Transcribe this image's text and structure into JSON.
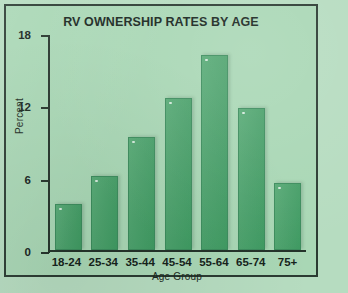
{
  "chart_data": {
    "type": "bar",
    "title": "RV OWNERSHIP RATES BY AGE",
    "xlabel": "Age Group",
    "ylabel": "Percent",
    "categories": [
      "18-24",
      "25-34",
      "35-44",
      "45-54",
      "55-64",
      "65-74",
      "75+"
    ],
    "values": [
      3.8,
      6.1,
      9.4,
      12.6,
      16.2,
      11.8,
      5.6
    ],
    "ylim": [
      0,
      18
    ],
    "yticks": [
      0,
      6,
      12,
      18
    ],
    "ytick_labels": [
      "0",
      "6",
      "12",
      "18"
    ],
    "grid": false,
    "legend": null,
    "series": [
      {
        "name": "Percent",
        "values": [
          3.8,
          6.1,
          9.4,
          12.6,
          16.2,
          11.8,
          5.6
        ]
      }
    ]
  },
  "colors": {
    "page_background": "#b6dcc0",
    "plot_background": "#a9d7b5",
    "frame_border": "#2b3b32",
    "bar_fill": "#4da26d",
    "bar_edge": "#3c8c5d",
    "text": "#16241c"
  }
}
